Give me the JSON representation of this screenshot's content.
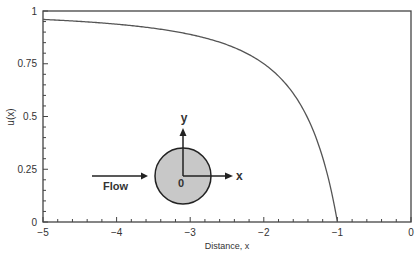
{
  "chart_data": {
    "type": "line",
    "title": "",
    "xlabel": "Distance, x",
    "ylabel": "u(x)",
    "xlim": [
      -5,
      0
    ],
    "ylim": [
      0,
      1
    ],
    "x_ticks": [
      "-5",
      "-4",
      "-3",
      "-2",
      "-1",
      "0"
    ],
    "y_ticks": [
      "0",
      "0.25",
      "0.5",
      "0.75",
      "1"
    ],
    "grid": false,
    "legend": null,
    "series": [
      {
        "name": "u(x) = 1 - 1/x^2",
        "x": [
          -5,
          -4.5,
          -4,
          -3.5,
          -3,
          -2.5,
          -2,
          -1.75,
          -1.5,
          -1.25,
          -1.1,
          -1
        ],
        "y": [
          0.96,
          0.951,
          0.9375,
          0.918,
          0.889,
          0.84,
          0.75,
          0.673,
          0.556,
          0.36,
          0.174,
          0
        ]
      }
    ],
    "annotations": {
      "flow_label": "Flow",
      "origin_label": "0",
      "x_axis_label": "x",
      "y_axis_label": "y",
      "cylinder_fill": "#c8c8c8"
    }
  }
}
